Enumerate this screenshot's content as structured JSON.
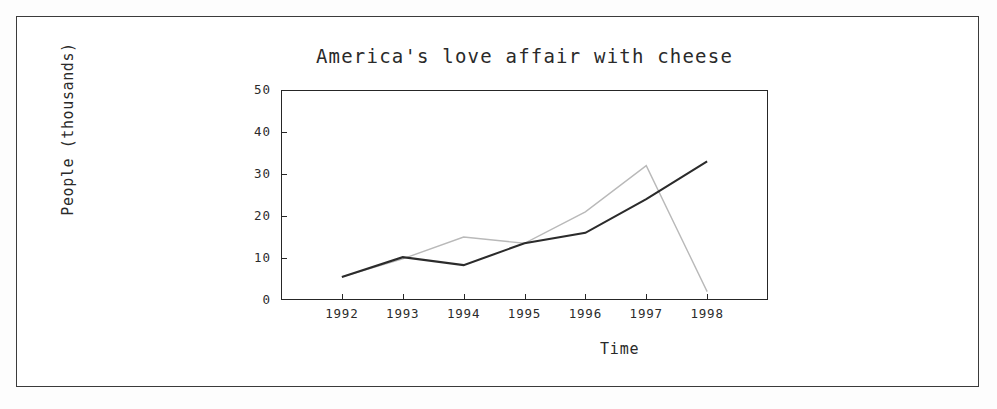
{
  "chart_data": {
    "type": "line",
    "title": "America's love affair with cheese",
    "xlabel": "Time",
    "ylabel": "People (thousands)",
    "categories": [
      "1992",
      "1993",
      "1994",
      "1995",
      "1996",
      "1997",
      "1998"
    ],
    "x": [
      1992,
      1993,
      1994,
      1995,
      1996,
      1997,
      1998
    ],
    "xlim": [
      1991.0,
      1999.0
    ],
    "ylim": [
      0,
      50
    ],
    "yticks": [
      "0",
      "10",
      "20",
      "30",
      "40",
      "50"
    ],
    "ytick_values": [
      0,
      10,
      20,
      30,
      40,
      50
    ],
    "grid": false,
    "legend": "none",
    "series": [
      {
        "name": "solid-dark-series",
        "color": "#2b2b2b",
        "style": "solid",
        "values": [
          5.5,
          10.2,
          8.3,
          13.5,
          16.0,
          24.0,
          33.0
        ]
      },
      {
        "name": "light-gray-series",
        "color": "#b9b9b9",
        "style": "solid",
        "values": [
          5.5,
          9.8,
          15.0,
          13.5,
          21.0,
          32.0,
          2.0
        ]
      }
    ]
  },
  "figure": {
    "title": "America's love affair with cheese",
    "axis_x_label": "Time",
    "axis_y_label": "People (thousands)"
  }
}
